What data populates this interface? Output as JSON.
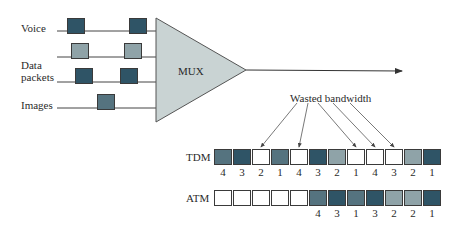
{
  "inputs": [
    {
      "label": "Voice",
      "y": 31
    },
    {
      "label": "",
      "y": 57
    },
    {
      "label": "Data\npackets",
      "y": 82
    },
    {
      "label": "Images",
      "y": 108
    }
  ],
  "labels": {
    "voice": "Voice",
    "data1": "Data",
    "data2": "packets",
    "images": "Images",
    "mux": "MUX",
    "wasted": "Wasted bandwidth",
    "tdm": "TDM",
    "atm": "ATM"
  },
  "colors": {
    "dark": "#2f5466",
    "medium": "#55737f",
    "light": "#8fa3a8",
    "mux_fill": "#c9d3d3",
    "empty": "#ffffff",
    "line": "#333333"
  },
  "input_packets": [
    {
      "x": 67,
      "y": 18,
      "shade": "dark"
    },
    {
      "x": 129,
      "y": 18,
      "shade": "dark"
    },
    {
      "x": 71,
      "y": 43,
      "shade": "light"
    },
    {
      "x": 124,
      "y": 43,
      "shade": "light"
    },
    {
      "x": 75,
      "y": 68,
      "shade": "dark"
    },
    {
      "x": 120,
      "y": 68,
      "shade": "dark"
    },
    {
      "x": 97,
      "y": 94,
      "shade": "medium"
    }
  ],
  "tdm": {
    "slots": [
      {
        "shade": "medium",
        "label": "4"
      },
      {
        "shade": "dark",
        "label": "3"
      },
      {
        "shade": "empty",
        "label": "2"
      },
      {
        "shade": "medium",
        "label": "1"
      },
      {
        "shade": "empty",
        "label": "4"
      },
      {
        "shade": "dark",
        "label": "3"
      },
      {
        "shade": "light",
        "label": "2"
      },
      {
        "shade": "empty",
        "label": "1"
      },
      {
        "shade": "empty",
        "label": "4"
      },
      {
        "shade": "empty",
        "label": "3"
      },
      {
        "shade": "light",
        "label": "2"
      },
      {
        "shade": "dark",
        "label": "1"
      }
    ]
  },
  "atm": {
    "slots": [
      {
        "shade": "empty",
        "label": ""
      },
      {
        "shade": "empty",
        "label": ""
      },
      {
        "shade": "empty",
        "label": ""
      },
      {
        "shade": "empty",
        "label": ""
      },
      {
        "shade": "empty",
        "label": ""
      },
      {
        "shade": "medium",
        "label": "4"
      },
      {
        "shade": "dark",
        "label": "3"
      },
      {
        "shade": "medium",
        "label": "1"
      },
      {
        "shade": "dark",
        "label": "3"
      },
      {
        "shade": "light",
        "label": "2"
      },
      {
        "shade": "light",
        "label": "2"
      },
      {
        "shade": "dark",
        "label": "1"
      }
    ]
  },
  "wasted_arrow_targets": [
    2,
    4,
    7,
    8,
    9
  ]
}
